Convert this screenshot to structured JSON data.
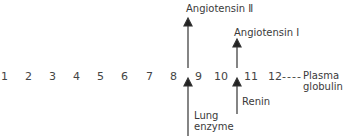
{
  "sequence": {
    "residues": [
      "1",
      "2",
      "3",
      "4",
      "5",
      "6",
      "7",
      "8",
      "9",
      "10",
      "11",
      "12"
    ],
    "tail_connector": "----",
    "tail_label_line1": "Plasma",
    "tail_label_line2": "globulin"
  },
  "cleavages": [
    {
      "between": "8-9",
      "product": "Angiotensin II",
      "product_label": "Angiotensin Ⅱ",
      "enzyme_line1": "Lung",
      "enzyme_line2": "enzyme"
    },
    {
      "between": "10-11",
      "product": "Angiotensin I",
      "product_label": "Angiotensin I",
      "enzyme_line1": "Renin"
    }
  ]
}
